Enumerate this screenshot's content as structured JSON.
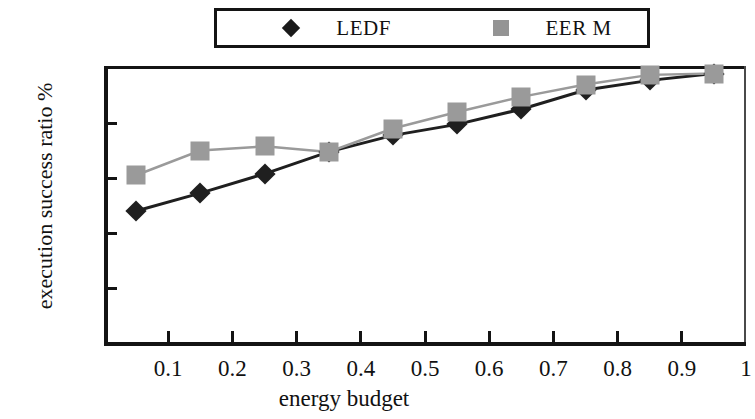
{
  "chart_data": {
    "type": "line",
    "title": "",
    "xlabel": "energy budget",
    "ylabel": "execution success ratio %",
    "xlim": [
      0,
      1
    ],
    "ylim": [
      0,
      100
    ],
    "xticks": [
      "0.1",
      "0.2",
      "0.3",
      "0.4",
      "0.5",
      "0.6",
      "0.7",
      "0.8",
      "0.9",
      "1"
    ],
    "xtick_values": [
      0.1,
      0.2,
      0.3,
      0.4,
      0.5,
      0.6,
      0.7,
      0.8,
      0.9,
      1.0
    ],
    "yticks": [
      "0",
      "20",
      "40",
      "60",
      "80",
      "100"
    ],
    "ytick_values": [
      0,
      20,
      40,
      60,
      80,
      100
    ],
    "grid": false,
    "legend_position": "top-center",
    "x": [
      0.05,
      0.15,
      0.25,
      0.35,
      0.45,
      0.55,
      0.65,
      0.75,
      0.85,
      0.95
    ],
    "series": [
      {
        "name": "LEDF",
        "marker": "diamond",
        "color": "#1f1f1f",
        "values": [
          48,
          54.5,
          61.5,
          69.5,
          75.5,
          79.5,
          85,
          92,
          95.5,
          98
        ]
      },
      {
        "name": "EER M",
        "marker": "square",
        "color": "#9a9a9a",
        "values": [
          61,
          70,
          71.5,
          69.5,
          78,
          84,
          89.5,
          94,
          97.5,
          98
        ]
      }
    ]
  },
  "legend": {
    "entries": [
      {
        "label": "LEDF",
        "marker": "diamond-marker-icon",
        "color": "#1a1a1a"
      },
      {
        "label": "EER M",
        "marker": "square-marker-icon",
        "color": "#949494"
      }
    ]
  }
}
